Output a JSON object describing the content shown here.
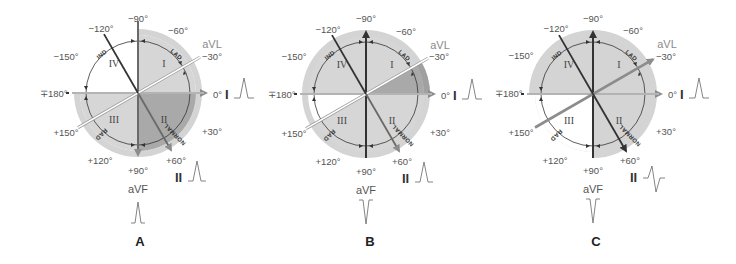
{
  "figure": {
    "panels": [
      {
        "letter": "A",
        "labels": {
          "m90": "−90°",
          "m60": "−60°",
          "m120": "−120°",
          "m150": "−150°",
          "m30": "−30°",
          "p180": "∓180°",
          "zero": "0°",
          "p30": "+30°",
          "p60": "+60°",
          "p90": "+90°",
          "p120": "+120°",
          "p150": "+150°",
          "avl": "aVL",
          "avf": "aVF",
          "leadI": "I",
          "leadII": "II"
        },
        "quadrants": [
          "I",
          "II",
          "III",
          "IV"
        ],
        "arcs": [
          "IND",
          "LAD",
          "NORMAL",
          "RAD"
        ],
        "lead_I_complex": "upright",
        "lead_II_complex": "upright",
        "aVF_complex": "upright"
      },
      {
        "letter": "B",
        "labels": {
          "m90": "−90°",
          "m60": "−60°",
          "m120": "−120°",
          "m150": "−150°",
          "m30": "−30°",
          "p180": "∓180°",
          "zero": "0°",
          "p30": "+30°",
          "p60": "+60°",
          "p90": "+90°",
          "p120": "+120°",
          "p150": "+150°",
          "avl": "aVL",
          "avf": "aVF",
          "leadI": "I",
          "leadII": "II"
        },
        "quadrants": [
          "I",
          "II",
          "III",
          "IV"
        ],
        "arcs": [
          "IND",
          "LAD",
          "NORMAL",
          "RAD"
        ],
        "lead_I_complex": "upright",
        "lead_II_complex": "upright",
        "aVF_complex": "inverted"
      },
      {
        "letter": "C",
        "labels": {
          "m90": "−90°",
          "m60": "−60°",
          "m120": "−120°",
          "m150": "−150°",
          "m30": "−30°",
          "p180": "∓180°",
          "zero": "0°",
          "p30": "+30°",
          "p60": "+60°",
          "p90": "+90°",
          "p120": "+120°",
          "p150": "+150°",
          "avl": "aVL",
          "avf": "aVF",
          "leadI": "I",
          "leadII": "II"
        },
        "quadrants": [
          "I",
          "II",
          "III",
          "IV"
        ],
        "arcs": [
          "IND",
          "LAD",
          "NORMAL",
          "RAD"
        ],
        "lead_I_complex": "upright",
        "lead_II_complex": "biphasic",
        "aVF_complex": "inverted"
      }
    ],
    "colors": {
      "light_shade": "#d4d4d4",
      "mid_shade": "#bdbdbd",
      "dark_shade": "#a6a6a6",
      "axis_line": "#3a3a3a",
      "gray_arrow": "#8c8c8c",
      "text": "#555555"
    }
  }
}
